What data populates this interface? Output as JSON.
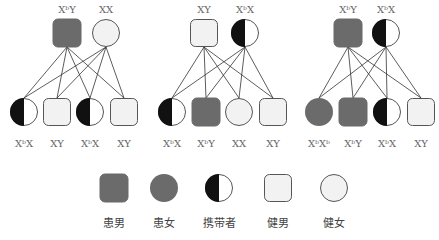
{
  "colors": {
    "affected": "#6b6b6b",
    "healthy_fill": "#f2f2f2",
    "carrier_dark": "#111111",
    "stroke": "#555555",
    "line": "#333333"
  },
  "panels": [
    {
      "parents": [
        {
          "type": "affected-male",
          "label_base": "X",
          "label_sup": "b",
          "label_rest": "Y",
          "cx": 67,
          "label": "XᵇY"
        },
        {
          "type": "healthy-female",
          "label": "XX",
          "cx": 106
        }
      ],
      "children": [
        {
          "type": "carrier-female",
          "label": "XᵇX",
          "cx": 24
        },
        {
          "type": "healthy-male",
          "label": "XY",
          "cx": 57
        },
        {
          "type": "carrier-female",
          "label": "XᵇX",
          "cx": 90
        },
        {
          "type": "healthy-male",
          "label": "XY",
          "cx": 124
        }
      ]
    },
    {
      "parents": [
        {
          "type": "healthy-male",
          "label": "XY",
          "cx": 204
        },
        {
          "type": "carrier-female",
          "label": "XᵇX",
          "cx": 245
        }
      ],
      "children": [
        {
          "type": "carrier-female",
          "label": "XᵇX",
          "cx": 172
        },
        {
          "type": "affected-male",
          "label": "XᵇY",
          "cx": 206
        },
        {
          "type": "healthy-female",
          "label": "XX",
          "cx": 239
        },
        {
          "type": "healthy-male",
          "label": "XY",
          "cx": 273
        }
      ]
    },
    {
      "parents": [
        {
          "type": "affected-male",
          "label": "XᵇY",
          "cx": 348
        },
        {
          "type": "carrier-female",
          "label": "XᵇX",
          "cx": 386
        }
      ],
      "children": [
        {
          "type": "affected-female",
          "label": "XᵇXᵇ",
          "cx": 319
        },
        {
          "type": "affected-male",
          "label": "XᵇY",
          "cx": 353
        },
        {
          "type": "carrier-female",
          "label": "XᵇX",
          "cx": 387
        },
        {
          "type": "healthy-male",
          "label": "XY",
          "cx": 421
        }
      ]
    }
  ],
  "legend": [
    {
      "type": "affected-male",
      "label": "患男",
      "cx": 114
    },
    {
      "type": "affected-female",
      "label": "患女",
      "cx": 164
    },
    {
      "type": "carrier-female",
      "label": "携带者",
      "cx": 219
    },
    {
      "type": "healthy-male",
      "label": "健男",
      "cx": 278
    },
    {
      "type": "healthy-female",
      "label": "健女",
      "cx": 334
    }
  ]
}
